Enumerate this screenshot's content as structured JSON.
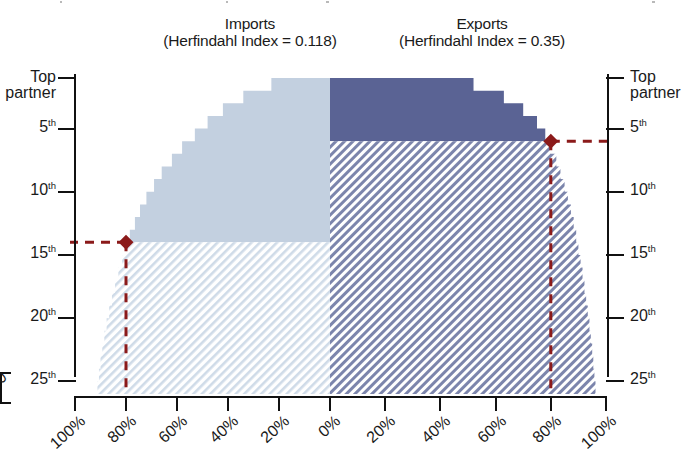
{
  "chart_data": {
    "type": "area",
    "xlabel": "",
    "ylabel": "Partner rank",
    "grid": false,
    "legend_position": "none",
    "orientation": "mirrored-horizontal",
    "panels": [
      {
        "name": "Imports",
        "side": "left",
        "title_main": "Imports",
        "title_sub": "(Herfindahl Index = 0.118)",
        "herfindahl_index": 0.118,
        "fill_solid_color": "#c3d0e0",
        "fill_hatch_color": "#cfdbe8",
        "x_direction": "right-to-left",
        "xlim": [
          0,
          100
        ],
        "ylim_ranks": [
          1,
          26
        ],
        "marker": {
          "rank": 14,
          "rank_label": "15th",
          "percent": 80,
          "color": "#8b1a1a",
          "shape": "diamond"
        },
        "cumulative_percent_by_rank": [
          {
            "rank": 1,
            "percent": 23
          },
          {
            "rank": 2,
            "percent": 34
          },
          {
            "rank": 3,
            "percent": 42
          },
          {
            "rank": 4,
            "percent": 48
          },
          {
            "rank": 5,
            "percent": 53
          },
          {
            "rank": 6,
            "percent": 58
          },
          {
            "rank": 7,
            "percent": 62
          },
          {
            "rank": 8,
            "percent": 66
          },
          {
            "rank": 9,
            "percent": 69
          },
          {
            "rank": 10,
            "percent": 72
          },
          {
            "rank": 11,
            "percent": 74.5
          },
          {
            "rank": 12,
            "percent": 76.5
          },
          {
            "rank": 13,
            "percent": 78.5
          },
          {
            "rank": 14,
            "percent": 80
          },
          {
            "rank": 15,
            "percent": 81.5
          },
          {
            "rank": 16,
            "percent": 83
          },
          {
            "rank": 17,
            "percent": 84.3
          },
          {
            "rank": 18,
            "percent": 85.5
          },
          {
            "rank": 19,
            "percent": 86.6
          },
          {
            "rank": 20,
            "percent": 87.6
          },
          {
            "rank": 21,
            "percent": 88.5
          },
          {
            "rank": 22,
            "percent": 89.3
          },
          {
            "rank": 23,
            "percent": 90
          },
          {
            "rank": 24,
            "percent": 90.6
          },
          {
            "rank": 25,
            "percent": 91.2
          },
          {
            "rank": 26,
            "percent": 91.8
          }
        ]
      },
      {
        "name": "Exports",
        "side": "right",
        "title_main": "Exports",
        "title_sub": "(Herfindahl Index = 0.35)",
        "herfindahl_index": 0.35,
        "fill_solid_color": "#5a6394",
        "fill_hatch_color": "#6b74a0",
        "x_direction": "left-to-right",
        "xlim": [
          0,
          100
        ],
        "ylim_ranks": [
          1,
          26
        ],
        "marker": {
          "rank": 6,
          "rank_label": "6th",
          "percent": 80,
          "color": "#8b1a1a",
          "shape": "diamond"
        },
        "cumulative_percent_by_rank": [
          {
            "rank": 1,
            "percent": 52
          },
          {
            "rank": 2,
            "percent": 63
          },
          {
            "rank": 3,
            "percent": 70
          },
          {
            "rank": 4,
            "percent": 75
          },
          {
            "rank": 5,
            "percent": 78
          },
          {
            "rank": 6,
            "percent": 80
          },
          {
            "rank": 7,
            "percent": 82
          },
          {
            "rank": 8,
            "percent": 83.5
          },
          {
            "rank": 9,
            "percent": 85
          },
          {
            "rank": 10,
            "percent": 86.2
          },
          {
            "rank": 11,
            "percent": 87.3
          },
          {
            "rank": 12,
            "percent": 88.3
          },
          {
            "rank": 13,
            "percent": 89.2
          },
          {
            "rank": 14,
            "percent": 90
          },
          {
            "rank": 15,
            "percent": 90.8
          },
          {
            "rank": 16,
            "percent": 91.5
          },
          {
            "rank": 17,
            "percent": 92.2
          },
          {
            "rank": 18,
            "percent": 92.8
          },
          {
            "rank": 19,
            "percent": 93.4
          },
          {
            "rank": 20,
            "percent": 94
          },
          {
            "rank": 21,
            "percent": 94.5
          },
          {
            "rank": 22,
            "percent": 95
          },
          {
            "rank": 23,
            "percent": 95.4
          },
          {
            "rank": 24,
            "percent": 95.8
          },
          {
            "rank": 25,
            "percent": 96.2
          },
          {
            "rank": 26,
            "percent": 96.6
          }
        ]
      }
    ],
    "y_ticks": [
      {
        "rank": 1,
        "label": "Top partner",
        "two_line": true,
        "line1": "Top",
        "line2": "partner"
      },
      {
        "rank": 5,
        "label": "5th",
        "num": "5",
        "ord": "th"
      },
      {
        "rank": 10,
        "label": "10th",
        "num": "10",
        "ord": "th"
      },
      {
        "rank": 15,
        "label": "15th",
        "num": "15",
        "ord": "th"
      },
      {
        "rank": 20,
        "label": "20th",
        "num": "20",
        "ord": "th"
      },
      {
        "rank": 25,
        "label": "25th",
        "num": "25",
        "ord": "th"
      }
    ],
    "x_ticks_left": [
      "100%",
      "80%",
      "60%",
      "40%",
      "20%",
      "0%"
    ],
    "x_ticks_right": [
      "20%",
      "40%",
      "60%",
      "80%",
      "100%"
    ],
    "colors": {
      "imports_solid": "#c3d0e0",
      "imports_hatch": "#cfdbe8",
      "exports_solid": "#5a6394",
      "exports_hatch": "#6b74a0",
      "marker": "#8b1a1a",
      "axis": "#111111",
      "text": "#1a1a1a"
    },
    "annotations": [
      {
        "text": "Imports 80% threshold reached at the 14th partner",
        "panel": "Imports"
      },
      {
        "text": "Exports 80% threshold reached at the 6th partner",
        "panel": "Exports"
      }
    ]
  },
  "clipped_left_fragment": {
    "label": "0"
  }
}
